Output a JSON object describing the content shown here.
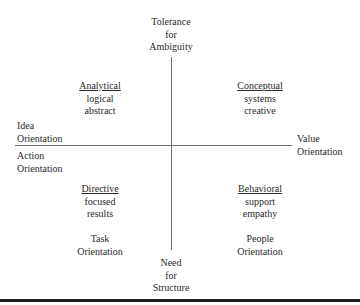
{
  "diagram": {
    "type": "quadrant",
    "axes": {
      "vertical": {
        "top_label": [
          "Tolerance",
          "for",
          "Ambiguity"
        ],
        "bottom_label": [
          "Need",
          "for",
          "Structure"
        ]
      },
      "horizontal": {
        "left_upper_label": [
          "Idea",
          "Orientation"
        ],
        "left_lower_label": [
          "Action",
          "Orientation"
        ],
        "right_label": [
          "Value",
          "Orientation"
        ]
      }
    },
    "quadrants": [
      {
        "position": "top-left",
        "title": "Analytical",
        "traits": [
          "logical",
          "abstract"
        ]
      },
      {
        "position": "top-right",
        "title": "Conceptual",
        "traits": [
          "systems",
          "creative"
        ]
      },
      {
        "position": "bottom-left",
        "title": "Directive",
        "traits": [
          "focused",
          "results"
        ],
        "orientation": [
          "Task",
          "Orientation"
        ]
      },
      {
        "position": "bottom-right",
        "title": "Behavioral",
        "traits": [
          "support",
          "empathy"
        ],
        "orientation": [
          "People",
          "Orientation"
        ]
      }
    ]
  }
}
